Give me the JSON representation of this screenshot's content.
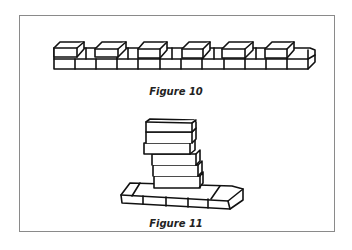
{
  "figures": [
    {
      "id": "figure-10",
      "caption": "Figure 10",
      "description": "A long row of bricks laid in two courses, with six bricks set on top at regular intervals"
    },
    {
      "id": "figure-11",
      "caption": "Figure 11",
      "description": "A tall leaning stack of bricks standing on a single row of base bricks"
    }
  ],
  "colors": {
    "ink": "#111111",
    "border": "#8a8a8a",
    "paper": "#ffffff"
  }
}
